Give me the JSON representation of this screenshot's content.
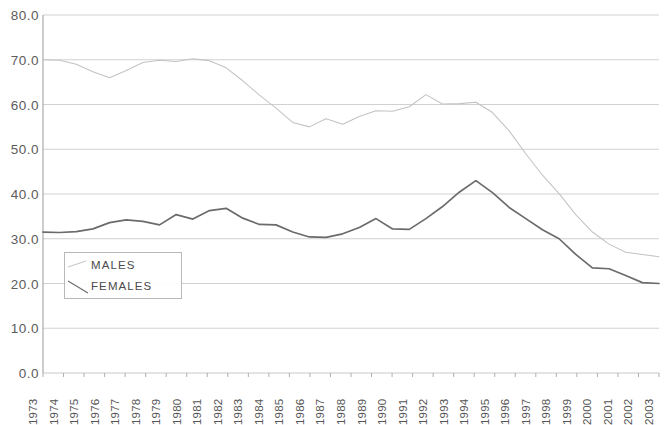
{
  "chart_data": {
    "type": "line",
    "title": "",
    "subtitle": "",
    "xlabel": "",
    "ylabel": "",
    "grid": true,
    "legend_position": "inside-lower-left",
    "xlim": [
      1973,
      2003
    ],
    "ylim": [
      0.0,
      80.0
    ],
    "ytick_step": 10.0,
    "ytick_labels": [
      "80.0",
      "70.0",
      "60.0",
      "50.0",
      "40.0",
      "30.0",
      "20.0",
      "10.0",
      "0.0"
    ],
    "ytick_values": [
      80.0,
      70.0,
      60.0,
      50.0,
      40.0,
      30.0,
      20.0,
      10.0,
      0.0
    ],
    "categories": [
      "1973",
      "1974",
      "1975",
      "1976",
      "1977",
      "1978",
      "1979",
      "1980",
      "1981",
      "1982",
      "1983",
      "1984",
      "1985",
      "1986",
      "1987",
      "1988",
      "1989",
      "1990",
      "1991",
      "1992",
      "1993",
      "1994",
      "1995",
      "1996",
      "1997",
      "1998",
      "1999",
      "2000",
      "2001",
      "2002",
      "2003"
    ],
    "series": [
      {
        "name": "MALES",
        "color": "#6b6b6b",
        "values": [
          31.5,
          31.4,
          31.6,
          32.2,
          33.6,
          34.2,
          33.9,
          33.1,
          35.4,
          34.4,
          36.3,
          36.8,
          34.6,
          33.2,
          33.1,
          31.5,
          30.4,
          30.3,
          31.1,
          32.5,
          34.5,
          32.2,
          32.1,
          34.5,
          37.2,
          40.4,
          43.0,
          40.3,
          37.0,
          34.5,
          32.0
        ]
      },
      {
        "name": "FEMALES",
        "color": "#c3c3c3",
        "values": [
          70.0,
          69.9,
          69.0,
          67.3,
          66.0,
          67.6,
          69.4,
          69.9,
          69.6,
          70.2,
          69.8,
          68.2,
          65.3,
          62.1,
          59.2,
          56.0,
          55.0,
          56.8,
          55.6,
          57.3,
          58.6,
          58.5,
          59.5,
          62.2,
          60.1,
          60.2,
          60.5,
          58.2,
          54.1,
          49.0,
          44.2
        ]
      }
    ],
    "series_tail": {
      "note": "values continue to end of axis",
      "males_tail": [
        30.0,
        26.5,
        23.5,
        23.3,
        21.8,
        20.2,
        20.0
      ],
      "females_tail": [
        40.1,
        35.4,
        31.5,
        28.8,
        27.0,
        26.5,
        26.0
      ]
    }
  },
  "legend": {
    "items": [
      {
        "label": "MALES"
      },
      {
        "label": "FEMALES"
      }
    ]
  },
  "axis": {
    "y_labels": [
      "80.0",
      "70.0",
      "60.0",
      "50.0",
      "40.0",
      "30.0",
      "20.0",
      "10.0",
      "0.0"
    ],
    "x_labels": [
      "1973",
      "1974",
      "1975",
      "1976",
      "1977",
      "1978",
      "1979",
      "1980",
      "1981",
      "1982",
      "1983",
      "1984",
      "1985",
      "1986",
      "1987",
      "1988",
      "1989",
      "1990",
      "1991",
      "1992",
      "1993",
      "1994",
      "1995",
      "1996",
      "1997",
      "1998",
      "1999",
      "2000",
      "2001",
      "2002",
      "2003"
    ]
  },
  "colors": {
    "males_line": "#6b6b6b",
    "females_line": "#c3c3c3",
    "gridline": "#c9c9c9",
    "axis": "#9a9a9a",
    "text": "#555555"
  }
}
